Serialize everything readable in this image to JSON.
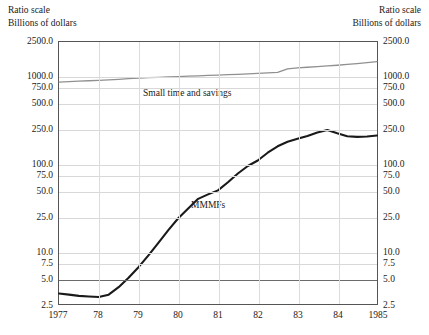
{
  "captions": {
    "left_line1": "Ratio scale",
    "left_line2": "Billions of dollars",
    "right_line1": "Ratio scale",
    "right_line2": "Billions of dollars"
  },
  "axes": {
    "y_tick_labels": [
      "2500.0",
      "1000.0",
      "750.0",
      "500.0",
      "250.0",
      "100.0",
      "75.0",
      "50.0",
      "25.0",
      "10.0",
      "7.5",
      "5.0",
      "2.5"
    ],
    "x_tick_labels": [
      "1977",
      "78",
      "79",
      "80",
      "81",
      "82",
      "83",
      "84",
      "1985"
    ]
  },
  "annotations": {
    "small_time_and_savings": "Small time and savings",
    "mmmfs": "MMMFs"
  },
  "colors": {
    "mmmfs_line": "#1a1a1a",
    "savings_line": "#909090",
    "grid": "#d8d8d8",
    "grid_emphasis": "#6b6b6b",
    "frame": "#555555"
  },
  "chart_data": {
    "type": "line",
    "title": "",
    "subtitle": "",
    "xlabel": "",
    "ylabel": "Billions of dollars",
    "scale": "log",
    "ylim": [
      2.5,
      2500.0
    ],
    "xlim": [
      1977,
      1985
    ],
    "grid": true,
    "legend": "inline-annotations",
    "y_ticks": [
      2500.0,
      1000.0,
      750.0,
      500.0,
      250.0,
      100.0,
      75.0,
      50.0,
      25.0,
      10.0,
      7.5,
      5.0,
      2.5
    ],
    "x_ticks": [
      1977,
      1978,
      1979,
      1980,
      1981,
      1982,
      1983,
      1984,
      1985
    ],
    "x": [
      1977.0,
      1977.25,
      1977.5,
      1977.75,
      1978.0,
      1978.25,
      1978.5,
      1978.75,
      1979.0,
      1979.25,
      1979.5,
      1979.75,
      1980.0,
      1980.25,
      1980.5,
      1980.75,
      1981.0,
      1981.25,
      1981.5,
      1981.75,
      1982.0,
      1982.25,
      1982.5,
      1982.75,
      1983.0,
      1983.25,
      1983.5,
      1983.75,
      1984.0,
      1984.25,
      1984.5,
      1984.75,
      1985.0
    ],
    "series": [
      {
        "name": "Small time and savings",
        "color": "#909090",
        "values": [
          870,
          880,
          890,
          900,
          910,
          920,
          935,
          950,
          965,
          975,
          985,
          995,
          1005,
          1015,
          1025,
          1035,
          1045,
          1055,
          1065,
          1080,
          1095,
          1110,
          1125,
          1230,
          1265,
          1285,
          1305,
          1330,
          1355,
          1385,
          1415,
          1450,
          1490
        ]
      },
      {
        "name": "MMMFs",
        "color": "#1a1a1a",
        "values": [
          3.3,
          3.2,
          3.1,
          3.05,
          3.0,
          3.2,
          3.9,
          5.0,
          6.6,
          9.0,
          12.5,
          17.5,
          24.0,
          31.0,
          40.0,
          45.0,
          50.0,
          62.0,
          78.0,
          95.0,
          110.0,
          135.0,
          160.0,
          180.0,
          195.0,
          210.0,
          230.0,
          245.0,
          225.0,
          208.0,
          205.0,
          207.0,
          212.0
        ]
      }
    ],
    "annotations": [
      {
        "text": "Small time and savings",
        "x": 1979.1,
        "y": 640
      },
      {
        "text": "MMMFs",
        "x": 1980.3,
        "y": 34
      }
    ]
  }
}
